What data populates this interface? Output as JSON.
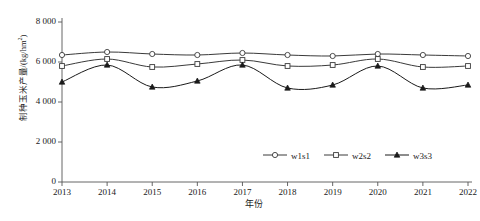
{
  "chart_data": {
    "type": "line",
    "title": "",
    "xlabel": "年份",
    "ylabel": "制种玉米产量/(kg/hm2)",
    "ylabel_main": "制种玉米产量/(kg/hm",
    "ylabel_sup": "2",
    "ylabel_tail": ")",
    "x": [
      2013,
      2014,
      2015,
      2016,
      2017,
      2018,
      2019,
      2020,
      2021,
      2022
    ],
    "categories": [
      "2013",
      "2014",
      "2015",
      "2016",
      "2017",
      "2018",
      "2019",
      "2020",
      "2021",
      "2022"
    ],
    "yticks": [
      0,
      2000,
      4000,
      6000,
      8000
    ],
    "ytick_labels": [
      "0",
      "2 000",
      "4 000",
      "6 000",
      "8 000"
    ],
    "ylim": [
      0,
      8000
    ],
    "xlim": [
      2013,
      2022
    ],
    "grid": false,
    "legend_position": "bottom-right",
    "series": [
      {
        "name": "w1s1",
        "marker": "circle-open",
        "color": "#3a3a3a",
        "values": [
          6350,
          6500,
          6400,
          6350,
          6450,
          6350,
          6300,
          6400,
          6350,
          6300
        ]
      },
      {
        "name": "w2s2",
        "marker": "square-open",
        "color": "#3a3a3a",
        "values": [
          5800,
          6150,
          5750,
          5900,
          6100,
          5800,
          5850,
          6150,
          5750,
          5800
        ]
      },
      {
        "name": "w3s3",
        "marker": "triangle-filled",
        "color": "#1a1a1a",
        "values": [
          5000,
          5850,
          4750,
          5050,
          5850,
          4700,
          4850,
          5800,
          4700,
          4850
        ]
      }
    ]
  },
  "axis": {
    "tick_color": "#555555",
    "axis_color": "#555555"
  }
}
